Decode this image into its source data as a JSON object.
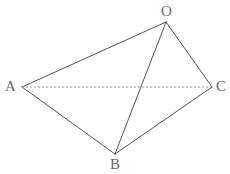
{
  "figure": {
    "background_color": "#ffffff",
    "width": 230,
    "height": 174,
    "solid_edge_color": "#555558",
    "dashed_edge_color": "#9a9a9e",
    "label_color": "#6a6a6e",
    "vertices": [
      {
        "id": "O",
        "label": "O",
        "x": 166,
        "y": 22,
        "label_x": 161,
        "label_y": 4
      },
      {
        "id": "A",
        "label": "A",
        "x": 22,
        "y": 87,
        "label_x": 5,
        "label_y": 79
      },
      {
        "id": "C",
        "label": "C",
        "x": 212,
        "y": 87,
        "label_x": 216,
        "label_y": 79
      },
      {
        "id": "B",
        "label": "B",
        "x": 115,
        "y": 154,
        "label_x": 110,
        "label_y": 157
      }
    ],
    "edges": [
      {
        "id": "AO",
        "from": "A",
        "to": "O",
        "style": "solid",
        "x1": 22,
        "y1": 87,
        "x2": 166,
        "y2": 22
      },
      {
        "id": "OC",
        "from": "O",
        "to": "C",
        "style": "solid",
        "x1": 166,
        "y1": 22,
        "x2": 212,
        "y2": 87
      },
      {
        "id": "OB",
        "from": "O",
        "to": "B",
        "style": "solid",
        "x1": 166,
        "y1": 22,
        "x2": 115,
        "y2": 154
      },
      {
        "id": "AB",
        "from": "A",
        "to": "B",
        "style": "solid",
        "x1": 22,
        "y1": 87,
        "x2": 115,
        "y2": 154
      },
      {
        "id": "BC",
        "from": "B",
        "to": "C",
        "style": "solid",
        "x1": 115,
        "y1": 154,
        "x2": 212,
        "y2": 87
      },
      {
        "id": "AC",
        "from": "A",
        "to": "C",
        "style": "dashed",
        "x1": 22,
        "y1": 87,
        "x2": 212,
        "y2": 87
      }
    ]
  }
}
